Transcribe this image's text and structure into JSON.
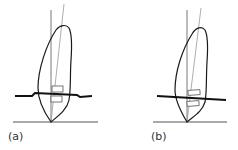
{
  "figure": {
    "panels": [
      {
        "id": "a",
        "label": "(a)",
        "description": "Tooth with bracket; archwire with step bend"
      },
      {
        "id": "b",
        "label": "(b)",
        "description": "Tooth with bracket; straight archwire"
      }
    ]
  },
  "colors": {
    "outline": "#1a1a1a",
    "thin_line": "#8a8a8a",
    "wire": "#111111",
    "background": "#ffffff"
  }
}
